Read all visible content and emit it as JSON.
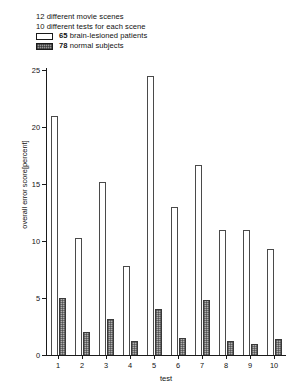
{
  "legend": {
    "line1": "12 different movie scenes",
    "line2": "10 different tests for each scene",
    "entry1_count": "65",
    "entry1_label": "brain-lesioned patients",
    "entry2_count": "78",
    "entry2_label": "normal subjects",
    "swatch1_name": "open-white-bar-swatch",
    "swatch2_name": "shaded-gray-bar-swatch"
  },
  "chart_data": {
    "type": "bar",
    "title": "",
    "xlabel": "test",
    "ylabel": "overall error score[percent]",
    "categories": [
      "1",
      "2",
      "3",
      "4",
      "5",
      "6",
      "7",
      "8",
      "9",
      "10"
    ],
    "ylim": [
      0,
      25
    ],
    "yticks": [
      0,
      5,
      10,
      15,
      20,
      25
    ],
    "ytick_labels": [
      "0",
      "5",
      "10",
      "15",
      "20",
      "25"
    ],
    "grid": false,
    "legend_position": "top-left",
    "series": [
      {
        "name": "65 brain-lesioned patients",
        "color": "#ffffff",
        "values": [
          21.0,
          10.3,
          15.2,
          7.8,
          24.5,
          13.0,
          16.7,
          11.0,
          11.0,
          9.3
        ]
      },
      {
        "name": "78 normal subjects",
        "color": "#b0b0b0",
        "values": [
          5.0,
          2.0,
          3.2,
          1.2,
          4.0,
          1.5,
          4.8,
          1.2,
          1.0,
          1.4
        ]
      }
    ]
  }
}
